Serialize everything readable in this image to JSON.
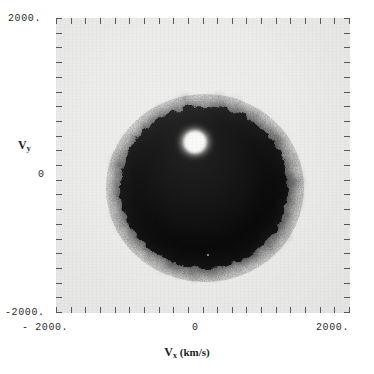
{
  "figure": {
    "type": "density-scatter",
    "background_color": "#ffffff",
    "plot_background_color": "#ececeb",
    "ink_color": "#141414"
  },
  "axes": {
    "x": {
      "title_symbol": "V",
      "title_subscript": "x",
      "title_units": "(km/s)",
      "title_full": "V_x (km/s)",
      "min": -2000,
      "max": 2000,
      "tick_labels": [
        "- 2000.",
        "0",
        "2000."
      ],
      "tick_count": 21,
      "minor_ticks": 20
    },
    "y": {
      "title_symbol": "V",
      "title_subscript": "y",
      "title_units": "",
      "title_full": "V_y",
      "min": -2000,
      "max": 2000,
      "tick_labels": [
        "2000.",
        "0",
        "-2000."
      ],
      "tick_count": 21,
      "minor_ticks": 20
    }
  },
  "chart_data": {
    "type": "scatter",
    "title": "",
    "subtitle": "",
    "xlabel": "V_x (km/s)",
    "ylabel": "V_y",
    "xlim": [
      -2000,
      2000
    ],
    "ylim": [
      -2000,
      2000
    ],
    "grid": false,
    "legend": "none",
    "structure": {
      "shape": "annulus",
      "center_vx": 0,
      "center_vy": 50,
      "hole_center_vx": 0,
      "hole_center_vy": 30,
      "hole_radius_kms": 150,
      "inner_dense_radius_kms": 320,
      "peak_density_radius_kms": 700,
      "outer_radius_kms": 1150,
      "diffuse_edge_radius_kms": 1300
    },
    "radial_profile": {
      "radius_kms": [
        0,
        100,
        150,
        250,
        350,
        500,
        650,
        800,
        950,
        1050,
        1150,
        1250,
        1350,
        1500
      ],
      "normalized_density": [
        0.02,
        0.05,
        0.18,
        0.55,
        0.8,
        0.95,
        1.0,
        0.97,
        0.88,
        0.72,
        0.45,
        0.18,
        0.05,
        0.0
      ]
    },
    "series": [
      {
        "name": "velocity points",
        "point_color": "#141414",
        "point_count_estimate": 12000
      }
    ]
  }
}
